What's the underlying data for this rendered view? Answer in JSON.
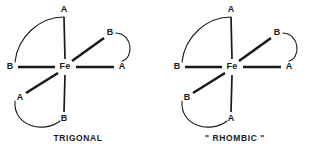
{
  "document": {
    "background_color": "#ffffff",
    "ink_color": "#1a1a1a"
  },
  "figures": [
    {
      "id": "trigonal",
      "caption": "TRIGONAL",
      "center": {
        "label": "Fe",
        "x": 65,
        "y": 67
      },
      "ligands": [
        {
          "position": "top",
          "label": "A",
          "x": 64,
          "y": 10,
          "bond_style": "thin",
          "bond_from_x": 65,
          "bond_from_y": 59,
          "bond_to_x": 64,
          "bond_to_y": 17
        },
        {
          "position": "left",
          "label": "B",
          "x": 10,
          "y": 67,
          "bond_style": "thick",
          "bond_from_x": 55,
          "bond_from_y": 67,
          "bond_to_x": 18,
          "bond_to_y": 67
        },
        {
          "position": "upper-right",
          "label": "B",
          "x": 110,
          "y": 33,
          "bond_style": "thick",
          "bond_from_x": 72,
          "bond_from_y": 61,
          "bond_to_x": 104,
          "bond_to_y": 38
        },
        {
          "position": "right",
          "label": "A",
          "x": 122,
          "y": 67,
          "bond_style": "thick",
          "bond_from_x": 76,
          "bond_from_y": 67,
          "bond_to_x": 114,
          "bond_to_y": 67
        },
        {
          "position": "lower-left",
          "label": "A",
          "x": 20,
          "y": 98,
          "bond_style": "thick",
          "bond_from_x": 58,
          "bond_from_y": 73,
          "bond_to_x": 26,
          "bond_to_y": 93
        },
        {
          "position": "bottom",
          "label": "B",
          "x": 64,
          "y": 119,
          "bond_style": "thin",
          "bond_from_x": 65,
          "bond_from_y": 75,
          "bond_to_x": 64,
          "bond_to_y": 112
        }
      ],
      "chelate_arcs": [
        {
          "from": "top",
          "to": "left",
          "path": "M 64 17 C 40 17, 18 36, 15 62"
        },
        {
          "from": "upper-right",
          "to": "right",
          "path": "M 116 33 C 133 34, 134 58, 122 61"
        },
        {
          "from": "lower-left",
          "to": "bottom",
          "path": "M 15 101 C 13 126, 43 134, 60 121"
        }
      ]
    },
    {
      "id": "rhombic",
      "caption": "\" RHOMBIC \"",
      "center": {
        "label": "Fe",
        "x": 75,
        "y": 67
      },
      "ligands": [
        {
          "position": "top",
          "label": "A",
          "x": 74,
          "y": 10,
          "bond_style": "thin",
          "bond_from_x": 75,
          "bond_from_y": 59,
          "bond_to_x": 74,
          "bond_to_y": 17
        },
        {
          "position": "left",
          "label": "B",
          "x": 20,
          "y": 67,
          "bond_style": "thick",
          "bond_from_x": 65,
          "bond_from_y": 67,
          "bond_to_x": 28,
          "bond_to_y": 67
        },
        {
          "position": "upper-right",
          "label": "B",
          "x": 120,
          "y": 33,
          "bond_style": "thick",
          "bond_from_x": 82,
          "bond_from_y": 61,
          "bond_to_x": 114,
          "bond_to_y": 38
        },
        {
          "position": "right",
          "label": "A",
          "x": 132,
          "y": 67,
          "bond_style": "thick",
          "bond_from_x": 86,
          "bond_from_y": 67,
          "bond_to_x": 124,
          "bond_to_y": 67
        },
        {
          "position": "lower-left",
          "label": "B",
          "x": 30,
          "y": 98,
          "bond_style": "thick",
          "bond_from_x": 68,
          "bond_from_y": 73,
          "bond_to_x": 36,
          "bond_to_y": 93
        },
        {
          "position": "bottom",
          "label": "A",
          "x": 74,
          "y": 119,
          "bond_style": "thin",
          "bond_from_x": 75,
          "bond_from_y": 75,
          "bond_to_x": 74,
          "bond_to_y": 112
        }
      ],
      "chelate_arcs": [
        {
          "from": "top",
          "to": "left",
          "path": "M 74 17 C 50 17, 28 36, 25 62"
        },
        {
          "from": "upper-right",
          "to": "right",
          "path": "M 126 33 C 143 34, 144 58, 132 61"
        },
        {
          "from": "lower-left",
          "to": "bottom",
          "path": "M 25 101 C 23 126, 53 134, 70 121"
        }
      ]
    }
  ]
}
